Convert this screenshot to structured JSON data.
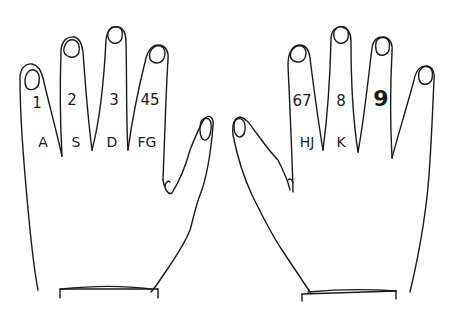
{
  "diagram": {
    "stroke_color": "#1a1a1a",
    "background": "#ffffff"
  },
  "left_hand": {
    "fingers": [
      {
        "finger": "little",
        "number": "1",
        "letters": "A"
      },
      {
        "finger": "ring",
        "number": "2",
        "letters": "S"
      },
      {
        "finger": "middle",
        "number": "3",
        "letters": "D"
      },
      {
        "finger": "index",
        "number": "45",
        "letters": "FG"
      }
    ]
  },
  "right_hand": {
    "fingers": [
      {
        "finger": "index",
        "number": "67",
        "letters": "HJ"
      },
      {
        "finger": "middle",
        "number": "8",
        "letters": "K"
      },
      {
        "finger": "ring",
        "number": "9",
        "letters": ""
      },
      {
        "finger": "little",
        "number": "",
        "letters": ""
      }
    ]
  }
}
